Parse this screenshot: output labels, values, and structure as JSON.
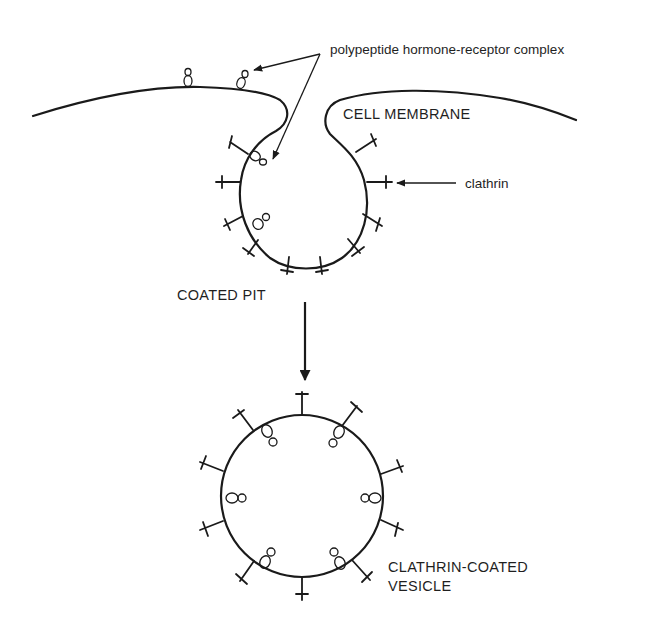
{
  "diagram": {
    "labels": {
      "complex": "polypeptide hormone-receptor complex",
      "membrane": "CELL MEMBRANE",
      "clathrin": "clathrin",
      "pit": "COATED PIT",
      "vesicle_line1": "CLATHRIN-COATED",
      "vesicle_line2": "VESICLE"
    },
    "colors": {
      "line": "#1a1a1a",
      "text": "#1f1f1f",
      "background": "#ffffff"
    },
    "stages": [
      {
        "name": "cell membrane with receptor complexes",
        "receptors_on_surface": 2
      },
      {
        "name": "coated pit",
        "clathrin_count": 11,
        "receptors_inside": 2
      },
      {
        "name": "clathrin-coated vesicle",
        "clathrin_count": 12,
        "receptors_inside": 6
      }
    ]
  }
}
